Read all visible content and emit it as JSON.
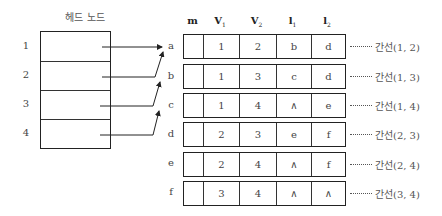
{
  "head_nodes": {
    "title": "헤드 노드",
    "rows": [
      {
        "index": "1"
      },
      {
        "index": "2"
      },
      {
        "index": "3"
      },
      {
        "index": "4"
      }
    ]
  },
  "edge_table": {
    "columns": [
      {
        "key": "m",
        "label": "m",
        "sub": ""
      },
      {
        "key": "v1",
        "label": "V",
        "sub": "1"
      },
      {
        "key": "v2",
        "label": "V",
        "sub": "2"
      },
      {
        "key": "l1",
        "label": "l",
        "sub": "1"
      },
      {
        "key": "l2",
        "label": "l",
        "sub": "2"
      }
    ],
    "rows": [
      {
        "label": "a",
        "m": "",
        "v1": "1",
        "v2": "2",
        "l1": "b",
        "l2": "d",
        "edge": "간선(1, 2)"
      },
      {
        "label": "b",
        "m": "",
        "v1": "1",
        "v2": "3",
        "l1": "c",
        "l2": "d",
        "edge": "간선(1, 3)"
      },
      {
        "label": "c",
        "m": "",
        "v1": "1",
        "v2": "4",
        "l1": "∧",
        "l2": "e",
        "edge": "간선(1, 4)"
      },
      {
        "label": "d",
        "m": "",
        "v1": "2",
        "v2": "3",
        "l1": "e",
        "l2": "f",
        "edge": "간선(2, 3)"
      },
      {
        "label": "e",
        "m": "",
        "v1": "2",
        "v2": "4",
        "l1": "∧",
        "l2": "f",
        "edge": "간선(2, 4)"
      },
      {
        "label": "f",
        "m": "",
        "v1": "3",
        "v2": "4",
        "l1": "∧",
        "l2": "∧",
        "edge": "간선(3, 4)"
      }
    ]
  },
  "pointers": [
    {
      "from": "1",
      "to": "a"
    },
    {
      "from": "2",
      "to": "a"
    },
    {
      "from": "3",
      "to": "b"
    },
    {
      "from": "4",
      "to": "c"
    }
  ]
}
